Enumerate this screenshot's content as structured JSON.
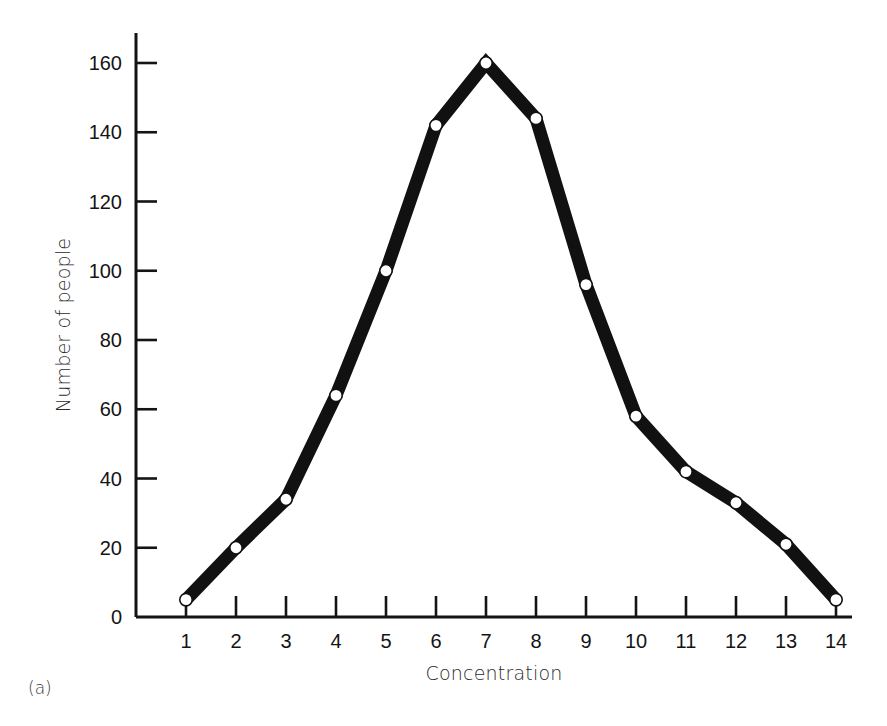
{
  "figure": {
    "caption": "(a)",
    "background_color": "#ffffff",
    "line_color": "#111111",
    "marker_fill_color": "#ffffff",
    "axis_color": "#141414"
  },
  "chart_data": {
    "type": "line",
    "title": "",
    "subtitle": "",
    "xlabel": "Concentration",
    "ylabel": "Number of people",
    "x": [
      1,
      2,
      3,
      4,
      5,
      6,
      7,
      8,
      9,
      10,
      11,
      12,
      13,
      14
    ],
    "values": [
      5,
      20,
      34,
      64,
      100,
      142,
      160,
      144,
      96,
      58,
      42,
      33,
      21,
      5
    ],
    "categories": [
      "1",
      "2",
      "3",
      "4",
      "5",
      "6",
      "7",
      "8",
      "9",
      "10",
      "11",
      "12",
      "13",
      "14"
    ],
    "xlim": [
      1,
      14
    ],
    "ylim": [
      0,
      160
    ],
    "xticks": [
      1,
      2,
      3,
      4,
      5,
      6,
      7,
      8,
      9,
      10,
      11,
      12,
      13,
      14
    ],
    "xtick_labels": [
      "1",
      "2",
      "3",
      "4",
      "5",
      "6",
      "7",
      "8",
      "9",
      "10",
      "11",
      "12",
      "13",
      "14"
    ],
    "yticks": [
      0,
      20,
      40,
      60,
      80,
      100,
      120,
      140,
      160
    ],
    "ytick_labels": [
      "0",
      "20",
      "40",
      "60",
      "80",
      "100",
      "120",
      "140",
      "160"
    ],
    "grid": false,
    "legend": false,
    "legend_position": "none",
    "marker": "open-circle",
    "series": [
      {
        "name": "Number of people",
        "values": [
          5,
          20,
          34,
          64,
          100,
          142,
          160,
          144,
          96,
          58,
          42,
          33,
          21,
          5
        ]
      }
    ],
    "annotations": []
  }
}
